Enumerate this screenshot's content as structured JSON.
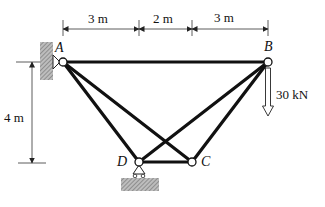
{
  "diagram": {
    "type": "truss",
    "nodes": {
      "A": {
        "label": "A",
        "x": 63,
        "y": 62
      },
      "B": {
        "label": "B",
        "x": 268,
        "y": 62
      },
      "C": {
        "label": "C",
        "x": 192,
        "y": 162
      },
      "D": {
        "label": "D",
        "x": 139,
        "y": 162
      }
    },
    "members": [
      [
        "A",
        "B"
      ],
      [
        "A",
        "D"
      ],
      [
        "A",
        "C"
      ],
      [
        "B",
        "D"
      ],
      [
        "B",
        "C"
      ],
      [
        "D",
        "C"
      ]
    ],
    "supports": {
      "A": "pin-to-wall",
      "D": "roller-on-ground"
    },
    "dimensions": {
      "horizontal": [
        "3 m",
        "2 m",
        "3 m"
      ],
      "vertical": "4 m"
    },
    "load": {
      "node": "B",
      "label": "30 kN",
      "direction": "down"
    },
    "colors": {
      "member": "#111111",
      "hatch": "#8a8a8a",
      "line": "#222222"
    }
  }
}
